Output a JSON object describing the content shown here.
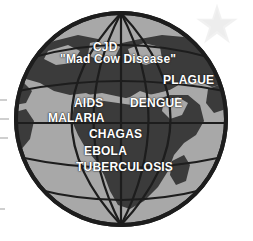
{
  "figure": {
    "kind": "globe-illustration"
  },
  "colors": {
    "background": "#ffffff",
    "ocean": "#a8a8a8",
    "land": "#3b3b3b",
    "outline": "#1d1d1d",
    "graticule": "#1d1d1d",
    "label_text": "#ffffff",
    "watermark": "#d4d4d4",
    "artifact": "#cfcfcf"
  },
  "globe": {
    "name": "world-globe",
    "graticule": {
      "meridians": 5,
      "parallels": 5,
      "prime_meridian_visible": true,
      "equator_visible": true
    }
  },
  "watermark": {
    "icon": "star-icon",
    "points": 5
  },
  "labels": [
    {
      "id": "cjd",
      "text": "CJD",
      "region": "northern-europe"
    },
    {
      "id": "mad-cow",
      "text": "\"Mad Cow Disease\"",
      "region": "northern-europe"
    },
    {
      "id": "plague",
      "text": "PLAGUE",
      "region": "central-asia"
    },
    {
      "id": "aids",
      "text": "AIDS",
      "region": "west-africa"
    },
    {
      "id": "dengue",
      "text": "DENGUE",
      "region": "arabian-peninsula"
    },
    {
      "id": "malaria",
      "text": "MALARIA",
      "region": "west-africa-atlantic"
    },
    {
      "id": "chagas",
      "text": "CHAGAS",
      "region": "central-africa"
    },
    {
      "id": "ebola",
      "text": "EBOLA",
      "region": "central-africa"
    },
    {
      "id": "tuberculosis",
      "text": "TUBERCULOSIS",
      "region": "southern-africa"
    }
  ]
}
